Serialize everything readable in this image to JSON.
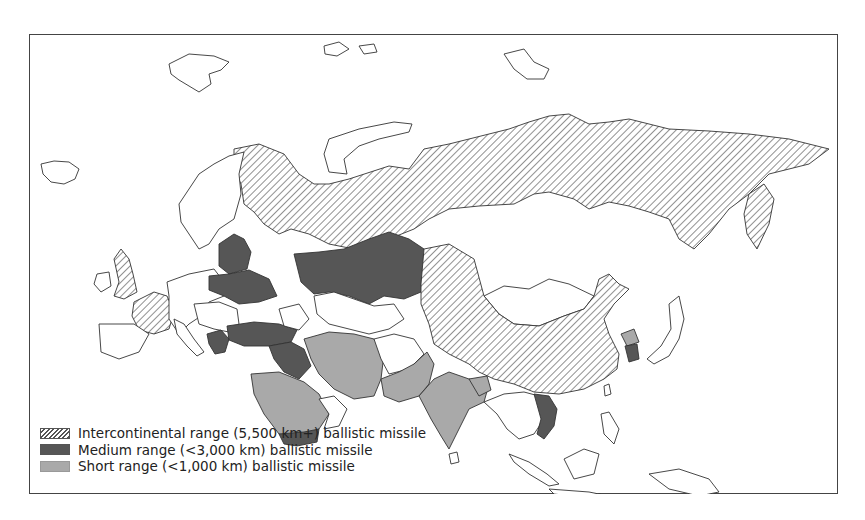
{
  "colors": {
    "intercontinental_hatch": "#555555",
    "medium_fill": "#565656",
    "short_fill": "#a9a9a9",
    "border": "#444444",
    "background": "#ffffff"
  },
  "legend": {
    "items": [
      {
        "key": "intercontinental",
        "label": "Intercontinental range (5,500 km+) ballistic missile",
        "pattern": "hatched"
      },
      {
        "key": "medium",
        "label": "Medium range (<3,000 km) ballistic missile",
        "pattern": "dark-gray"
      },
      {
        "key": "short",
        "label": "Short range (<1,000 km) ballistic missile",
        "pattern": "light-gray"
      }
    ]
  },
  "regions": {
    "intercontinental": [
      "Russia",
      "China",
      "United Kingdom",
      "France"
    ],
    "medium": [
      "Belarus",
      "Ukraine",
      "Kazakhstan",
      "Turkey",
      "Syria",
      "Iraq",
      "Yemen",
      "Greece",
      "South Korea",
      "Vietnam"
    ],
    "short": [
      "Iran",
      "Saudi Arabia",
      "Pakistan",
      "India",
      "Afghanistan-region",
      "North Korea",
      "Myanmar-border-region"
    ]
  }
}
